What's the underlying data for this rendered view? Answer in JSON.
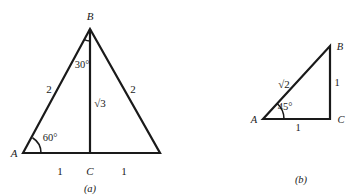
{
  "figures": [
    {
      "id": "a",
      "caption": "(a)",
      "description": "Equilateral triangle of side 2 split by altitude into two 30-60-90 triangles",
      "vertices": {
        "A": {
          "label": "A",
          "x": 23,
          "y": 153
        },
        "B": {
          "label": "B",
          "x": 90,
          "y": 29
        },
        "C": {
          "label": "C",
          "x": 90,
          "y": 153
        },
        "D": {
          "label": "",
          "x": 160,
          "y": 153
        }
      },
      "labels": {
        "vertex_A": "A",
        "vertex_B": "B",
        "vertex_C": "C",
        "side_left": "2",
        "side_right": "2",
        "altitude": "√3",
        "base_left": "1",
        "base_right": "1",
        "angle_A": "60°",
        "angle_B": "30°",
        "caption": "(a)"
      }
    },
    {
      "id": "b",
      "caption": "(b)",
      "description": "Isosceles right triangle with legs 1 and hypotenuse √2",
      "vertices": {
        "A": {
          "label": "A",
          "x": 263,
          "y": 119
        },
        "B": {
          "label": "B",
          "x": 330,
          "y": 46
        },
        "C": {
          "label": "C",
          "x": 330,
          "y": 119
        }
      },
      "labels": {
        "vertex_A": "A",
        "vertex_B": "B",
        "vertex_C": "C",
        "hypotenuse": "√2",
        "side_vertical": "1",
        "side_base": "1",
        "angle_A": "45°",
        "caption": "(b)"
      }
    }
  ]
}
